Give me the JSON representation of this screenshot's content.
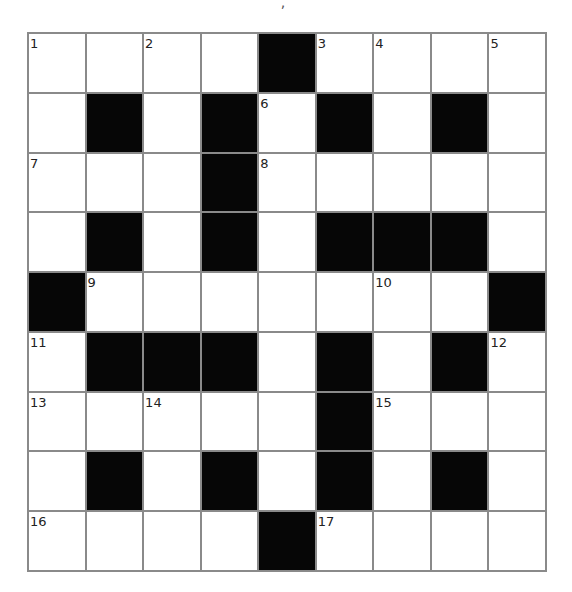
{
  "puzzle": {
    "top_fragment": ",",
    "rows": 9,
    "cols": 9,
    "colors": {
      "block": "#060606",
      "cell": "#ffffff",
      "gridline": "#8a8a8a",
      "number": "#222222"
    },
    "grid": [
      [
        "1",
        ".",
        "2",
        ".",
        "#",
        "3",
        "4",
        ".",
        "5"
      ],
      [
        ".",
        "#",
        ".",
        "#",
        "6",
        "#",
        ".",
        "#",
        "."
      ],
      [
        "7",
        ".",
        ".",
        "#",
        "8",
        ".",
        ".",
        ".",
        "."
      ],
      [
        ".",
        "#",
        ".",
        "#",
        ".",
        "#",
        "#",
        "#",
        "."
      ],
      [
        "#",
        "9",
        ".",
        ".",
        ".",
        ".",
        "10",
        ".",
        "#"
      ],
      [
        "11",
        "#",
        "#",
        "#",
        ".",
        "#",
        ".",
        "#",
        "12"
      ],
      [
        "13",
        ".",
        "14",
        ".",
        ".",
        "#",
        "15",
        ".",
        "."
      ],
      [
        ".",
        "#",
        ".",
        "#",
        ".",
        "#",
        ".",
        "#",
        "."
      ],
      [
        "16",
        ".",
        ".",
        ".",
        "#",
        "17",
        ".",
        ".",
        "."
      ]
    ],
    "letters": [
      [
        "",
        "",
        "",
        "",
        "",
        "",
        "",
        "",
        ""
      ],
      [
        "",
        "",
        "",
        "",
        "",
        "",
        "",
        "",
        ""
      ],
      [
        "",
        "",
        "",
        "",
        "",
        "",
        "",
        "",
        ""
      ],
      [
        "",
        "",
        "",
        "",
        "",
        "",
        "",
        "",
        ""
      ],
      [
        "",
        "",
        "",
        "",
        "",
        "",
        "",
        "",
        ""
      ],
      [
        "",
        "",
        "",
        "",
        "",
        "",
        "",
        "",
        ""
      ],
      [
        "",
        "",
        "",
        "",
        "",
        "",
        "",
        "",
        ""
      ],
      [
        "",
        "",
        "",
        "",
        "",
        "",
        "",
        "",
        ""
      ],
      [
        "",
        "",
        "",
        "",
        "",
        "",
        "",
        "",
        ""
      ]
    ]
  }
}
